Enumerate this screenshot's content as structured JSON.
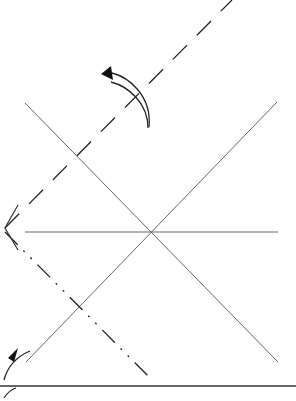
{
  "diagram": {
    "type": "origami-fold-step",
    "background": "#ffffff",
    "line_color": "#555555",
    "ink_color": "#1a1a1a",
    "crease_lines": [
      {
        "name": "crease-diagonal-down",
        "x1": 25,
        "y1": 103,
        "x2": 278,
        "y2": 362
      },
      {
        "name": "crease-diagonal-up",
        "x1": 26,
        "y1": 362,
        "x2": 277,
        "y2": 102
      },
      {
        "name": "crease-horizontal",
        "x1": 25,
        "y1": 232,
        "x2": 278,
        "y2": 232
      }
    ],
    "valley_fold_line": {
      "x1": 5,
      "y1": 228,
      "x2": 232,
      "y2": 0
    },
    "mountain_fold_line": {
      "x1": 5,
      "y1": 232,
      "x2": 150,
      "y2": 378
    },
    "base_edge": {
      "x1": 0,
      "y1": 386,
      "x2": 296,
      "y2": 386
    },
    "arrows": [
      {
        "name": "fold-arrow-top",
        "direction": "counterclockwise"
      },
      {
        "name": "fold-arrow-bottom-left",
        "direction": "up-right"
      }
    ]
  }
}
